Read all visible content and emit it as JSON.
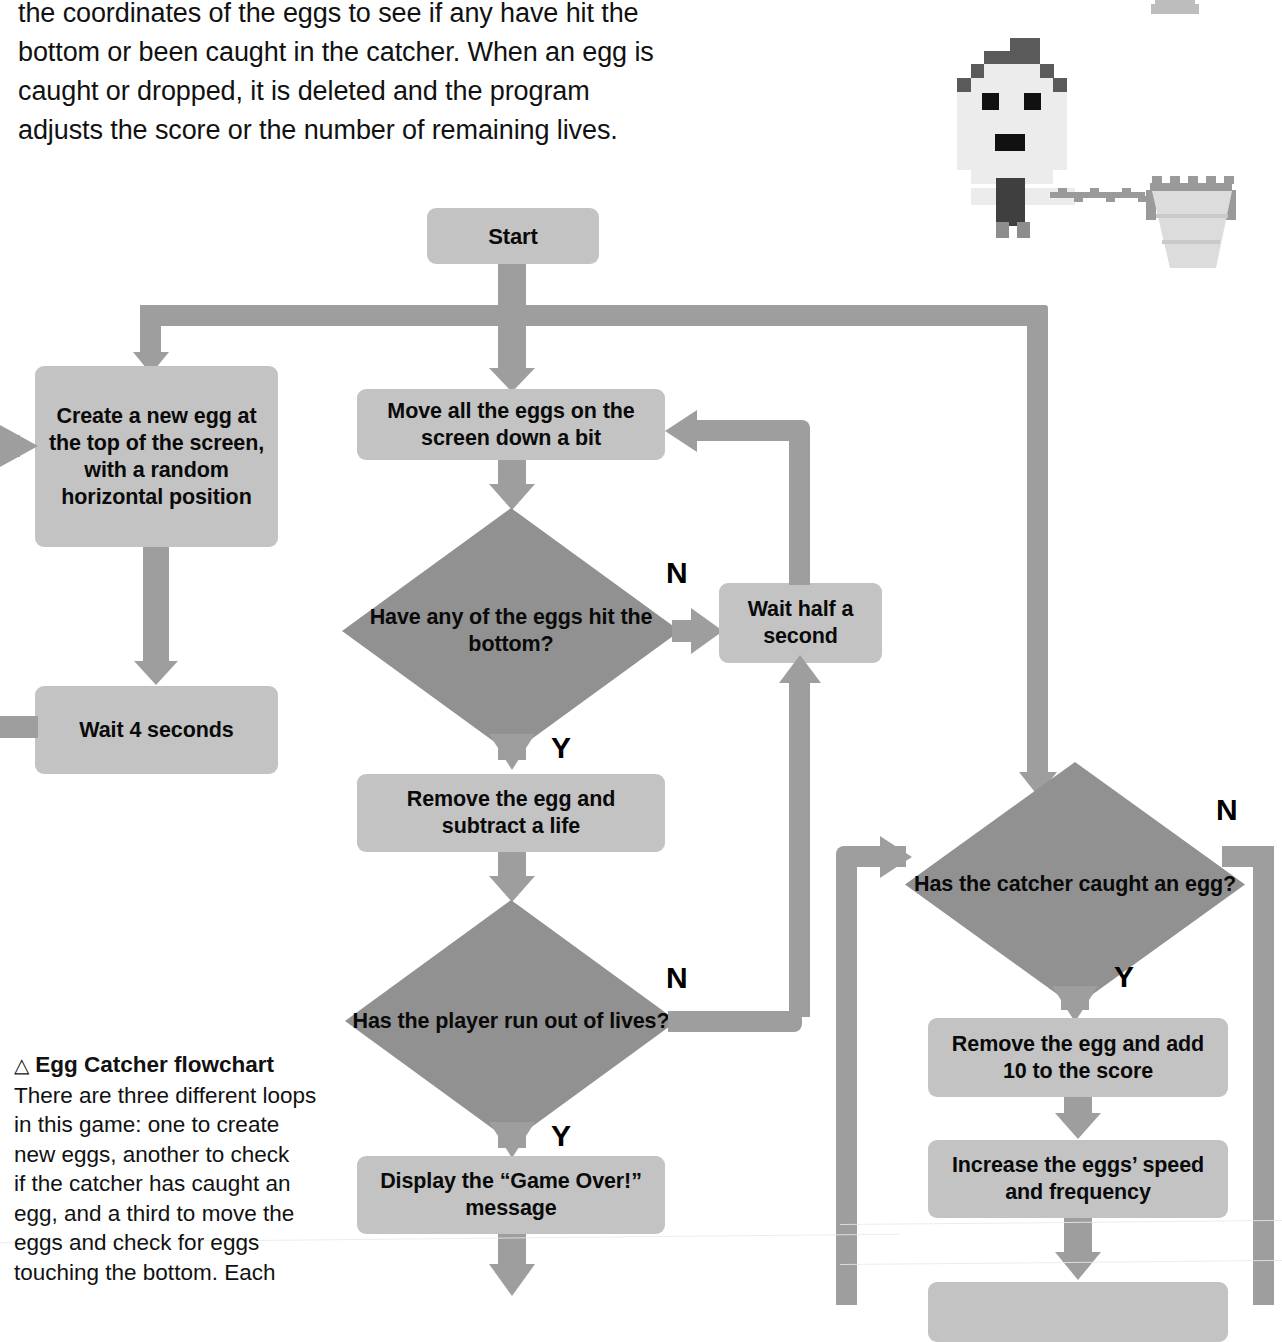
{
  "intro": {
    "lines": [
      "the coordinates of the eggs to see if any have hit the",
      "bottom or been caught in the catcher. When an egg is",
      "caught or dropped, it is deleted and the program",
      "adjusts the score or the number of remaining lives."
    ]
  },
  "caption": {
    "marker": "△",
    "title": "Egg Catcher flowchart",
    "lines": [
      "There are three different loops",
      "in this game: one to create",
      "new eggs, another to check",
      "if the catcher has caught an",
      "egg, and a third to move the",
      "eggs and check for eggs",
      "touching the bottom. Each"
    ]
  },
  "colors": {
    "process_fill": "#c3c3c3",
    "decision_fill": "#919191",
    "connector": "#9e9e9e",
    "text": "#0a0a0a",
    "page_background": "#ffffff"
  },
  "flowchart": {
    "title": "Egg Catcher flowchart",
    "nodes": [
      {
        "id": "start",
        "type": "terminal",
        "label": "Start"
      },
      {
        "id": "create_egg",
        "type": "process",
        "label": "Create a new egg at the top of the screen, with a random horizontal position"
      },
      {
        "id": "wait4",
        "type": "process",
        "label": "Wait 4 seconds"
      },
      {
        "id": "move_eggs",
        "type": "process",
        "label": "Move all the eggs on the screen down a bit"
      },
      {
        "id": "hit_bottom",
        "type": "decision",
        "label": "Have any of the eggs hit the bottom?"
      },
      {
        "id": "wait_half",
        "type": "process",
        "label": "Wait half a second"
      },
      {
        "id": "remove_life",
        "type": "process",
        "label": "Remove the egg and subtract a life"
      },
      {
        "id": "out_of_lives",
        "type": "decision",
        "label": "Has the player run out of lives?"
      },
      {
        "id": "game_over",
        "type": "process",
        "label": "Display the “Game Over!” message"
      },
      {
        "id": "caught_egg",
        "type": "decision",
        "label": "Has the catcher caught an egg?"
      },
      {
        "id": "add_score",
        "type": "process",
        "label": "Remove the egg and add 10 to the score"
      },
      {
        "id": "increase",
        "type": "process",
        "label": "Increase the eggs’ speed and frequency"
      },
      {
        "id": "wait_bottom",
        "type": "process",
        "label": ""
      }
    ],
    "branch_labels": {
      "hit_bottom_no": "N",
      "hit_bottom_yes": "Y",
      "out_of_lives_no": "N",
      "out_of_lives_yes": "Y",
      "caught_egg_no": "N",
      "caught_egg_yes": "Y"
    }
  },
  "sprite": {
    "name": "egg-catcher-character",
    "description": "pixel-art character holding a net"
  }
}
